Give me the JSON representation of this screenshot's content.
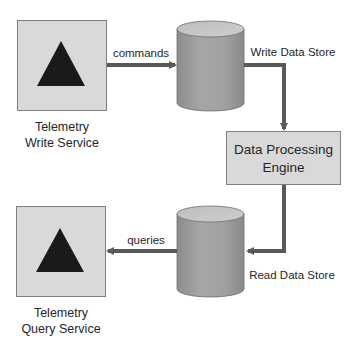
{
  "diagram": {
    "title": "",
    "nodes": {
      "write_service": {
        "line1": "Telemetry",
        "line2": "Write Service",
        "icon": "triangle-icon"
      },
      "write_store": {
        "label": "Write Data Store",
        "icon": "database-cylinder-icon"
      },
      "engine": {
        "line1": "Data Processing",
        "line2": "Engine"
      },
      "read_store": {
        "label": "Read Data Store",
        "icon": "database-cylinder-icon"
      },
      "query_service": {
        "line1": "Telemetry",
        "line2": "Query Service",
        "icon": "triangle-icon"
      }
    },
    "edges": {
      "commands": {
        "label": "commands",
        "from": "write_service",
        "to": "write_store"
      },
      "write_to_engine": {
        "label": "",
        "from": "write_store",
        "to": "engine"
      },
      "engine_to_read": {
        "label": "",
        "from": "engine",
        "to": "read_store"
      },
      "queries": {
        "label": "queries",
        "from": "read_store",
        "to": "query_service"
      }
    },
    "colors": {
      "box_fill": "#d9d9d9",
      "box_stroke": "#7f7f7f",
      "triangle": "#1a1a1a",
      "cylinder_body": "#9a9a9a",
      "cylinder_top": "#c4c4c4",
      "arrow": "#595959",
      "text": "#262626"
    }
  }
}
